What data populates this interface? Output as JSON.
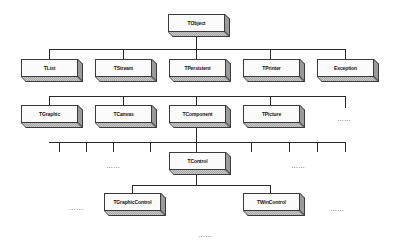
{
  "diagram": {
    "title": "",
    "root": {
      "label": "TObject"
    },
    "level1": [
      {
        "label": "TList"
      },
      {
        "label": "TStream"
      },
      {
        "label": "TPersistent"
      },
      {
        "label": "TPrinter"
      },
      {
        "label": "Exception"
      }
    ],
    "level2": [
      {
        "label": "TGraphic"
      },
      {
        "label": "TCanvas"
      },
      {
        "label": "TComponent"
      },
      {
        "label": "TPicture"
      }
    ],
    "level2_more": "……",
    "level3": {
      "label": "TControl"
    },
    "level3_more_left": "……",
    "level3_more_right": "……",
    "level4": [
      {
        "label": "TGraphicControl"
      },
      {
        "label": "TWinControl"
      }
    ],
    "level4_more_left": "……",
    "level4_more_right": "……",
    "level5_more": "……",
    "edges": [
      [
        "TObject",
        "TList"
      ],
      [
        "TObject",
        "TStream"
      ],
      [
        "TObject",
        "TPersistent"
      ],
      [
        "TObject",
        "TPrinter"
      ],
      [
        "TObject",
        "Exception"
      ],
      [
        "TPersistent",
        "TGraphic"
      ],
      [
        "TPersistent",
        "TCanvas"
      ],
      [
        "TPersistent",
        "TComponent"
      ],
      [
        "TPersistent",
        "TPicture"
      ],
      [
        "TPersistent",
        "……"
      ],
      [
        "TComponent",
        "TControl"
      ],
      [
        "TControl",
        "TGraphicControl"
      ],
      [
        "TControl",
        "TWinControl"
      ]
    ]
  }
}
